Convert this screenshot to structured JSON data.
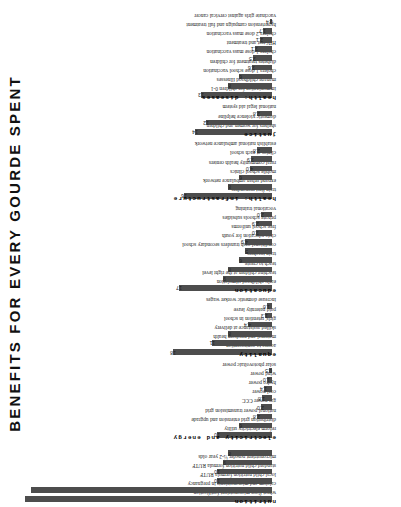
{
  "title": "BENEFITS FOR EVERY GOURDE SPENT",
  "colors": {
    "bar": "#4d4d4d",
    "text": "#1a1a1a",
    "background": "#ffffff"
  },
  "chart_data": {
    "type": "bar",
    "title": "BENEFITS FOR EVERY GOURDE SPENT",
    "xlabel": "",
    "ylabel": "",
    "ylim": [
      0,
      45
    ],
    "grid": false,
    "legend": null,
    "orientation": "vertical-bars-rotated-page",
    "note": "First two bars are clipped by the top edge of the figure; no value labels shown for them.",
    "groups": [
      {
        "group": "nutrition",
        "categories": [
          "wheat flour micronutrient fortification",
          "calcium and micronutrients in pregnancy",
          "local child nutrition formula RUTF",
          "standard child nutrition formula RUTF",
          "micronutrient powder ½-2 year olds"
        ],
        "values": [
          45,
          44,
          10,
          10,
          9,
          8
        ],
        "labels": [
          "",
          "",
          "10",
          "10",
          "9",
          "8"
        ]
      },
      {
        "group": "electricity and energy",
        "categories": [
          "reform electricity utility",
          "distribution grid extension and upgrade",
          "national power transmission grid",
          "gas power CCC",
          "coal power",
          "hydro power",
          "wind power",
          "solar photovoltaic power",
          "solar reflective power"
        ],
        "values": [
          10,
          6,
          2.8,
          2.0,
          1.8,
          1.4,
          1.0,
          0.5
        ],
        "labels": [
          "10",
          "6",
          "2.8",
          "2.0",
          "1.8",
          "1.4",
          "1.0",
          "0.5"
        ]
      },
      {
        "group": "equality",
        "categories": [
          "access to contraception",
          "maternal and newborn health",
          "skilled assistance at delivery",
          "girls' retention in school",
          "paid paternity leave",
          "increase domestic worker wages"
        ],
        "values": [
          18,
          11,
          8,
          4.4,
          1.3,
          1.0
        ],
        "labels": [
          "18",
          "11",
          "8",
          "4.4",
          "1.3",
          "1.0"
        ]
      },
      {
        "group": "education",
        "categories": [
          "early childhood stimulation",
          "teaching children at the right level",
          "teach to create",
          "train teachers",
          "conditional cash transfers secondary school",
          "civic education for youth",
          "free school uniforms",
          "private schools subsidies",
          "vocational training"
        ],
        "values": [
          17,
          9,
          8,
          6,
          5,
          4.9,
          3.0,
          2.9,
          2.0
        ],
        "labels": [
          "17",
          "9",
          "8",
          "6",
          "5",
          "4.9",
          "3.0",
          "2.9",
          "2.0"
        ]
      },
      {
        "group": "health: infrastructure",
        "categories": [
          "train first responders",
          "expand urban ambulance network",
          "mobile school clinics",
          "rural community health centers",
          "clinics at each school",
          "establish national ambulance network"
        ],
        "values": [
          16,
          8,
          6,
          4.0,
          3.9,
          2.8
        ],
        "labels": [
          "16",
          "8",
          "6",
          "4.0",
          "3.9",
          "2.8"
        ]
      },
      {
        "group": "justice",
        "categories": [
          "shelters for women and children",
          "domestic violence helpline",
          "national legal aid system",
          "prevent teen dating violence"
        ],
        "values": [
          14,
          12,
          2.8
        ],
        "labels": [
          "14",
          "12",
          "2.8"
        ]
      },
      {
        "group": "health: diseases",
        "categories": [
          "immunization for children 0-1",
          "manage childhood illnesses",
          "cholera 1 dose school vaccination",
          "diabetes treatment for children",
          "cholera 1 dose mass vaccination",
          "HIV test and treatment",
          "cholera 2 dose mass vaccination",
          "hypertension campaign and full treatment",
          "vaccinate girls against cervical cancer"
        ],
        "values": [
          13,
          8,
          6,
          3.6,
          3.5,
          3.1,
          2.1,
          1.7,
          0.4
        ],
        "labels": [
          "13",
          "8",
          "6",
          "3.6",
          "3.5",
          "3.1",
          "2.1",
          "1.7",
          "0.4"
        ]
      }
    ]
  }
}
